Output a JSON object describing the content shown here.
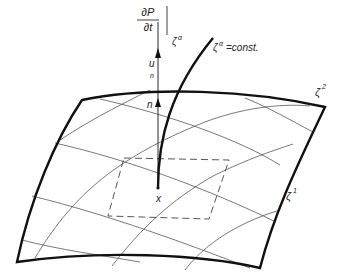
{
  "diagram": {
    "type": "curved surface with curvilinear coordinate grid",
    "labels": {
      "partial_num": "∂P",
      "partial_den": "∂t",
      "partial_subscript": "ζ",
      "partial_subscript_sup": "α",
      "curve_label_base": "ζ",
      "curve_label_sup": "α",
      "curve_label_rest": "=const.",
      "u_label": "u",
      "u_sub": "n",
      "n_label": "n",
      "x_label": "x",
      "zeta2_base": "ζ",
      "zeta2_sup": "2",
      "zeta1_base": "ζ",
      "zeta1_sup": "1"
    },
    "colors": {
      "stroke": "#111111",
      "grid": "#555555",
      "background": "#ffffff"
    }
  }
}
